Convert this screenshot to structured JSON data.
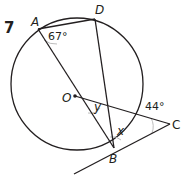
{
  "question_number": "7",
  "points": {
    "A": "A",
    "D": "D",
    "O": "O",
    "B": "B",
    "C": "C"
  },
  "angles": {
    "angle_A": "67°",
    "angle_C": "44°",
    "unknown_y": "y",
    "unknown_x": "x"
  },
  "colors": {
    "line": "#231f20",
    "arc_marker": "#bdbdbd"
  }
}
